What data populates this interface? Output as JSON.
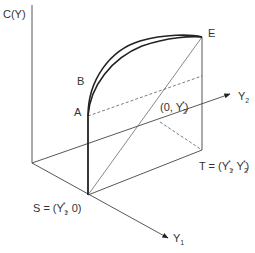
{
  "diagram": {
    "axes": {
      "vertical": "C(Y)",
      "y1": "Y",
      "y1_sub": "1",
      "y2": "Y",
      "y2_sub": "2"
    },
    "points": {
      "A": "A",
      "B": "B",
      "E": "E",
      "S_prefix": "S = (Y",
      "S_sub": "1",
      "S_sup": "*",
      "S_suffix": ", 0)",
      "T_prefix": "T = (Y",
      "T_sub1": "1",
      "T_sup1": "*",
      "T_mid": ", Y",
      "T_sub2": "2",
      "T_sup2": "*",
      "T_suffix": ")",
      "P_prefix": "(0, Y",
      "P_sub": "2",
      "P_sup": "*",
      "P_suffix": ")"
    },
    "colors": {
      "line": "#333333",
      "curve": "#222222"
    }
  }
}
